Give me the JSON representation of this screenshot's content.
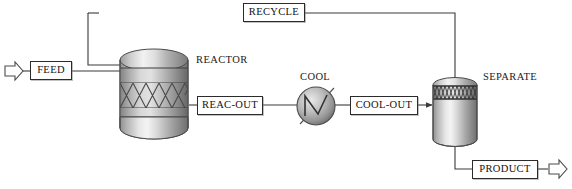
{
  "diagram": {
    "background_color": "#ffffff",
    "line_color": "#3a3a3a",
    "text_color": "#111111",
    "width": 572,
    "height": 189
  },
  "unit_labels": [
    {
      "id": "reactor",
      "text": "REACTOR",
      "x": 196,
      "y": 55
    },
    {
      "id": "cool",
      "text": "COOL",
      "x": 300,
      "y": 72
    },
    {
      "id": "separate",
      "text": "SEPARATE",
      "x": 483,
      "y": 72
    }
  ],
  "stream_labels": [
    {
      "id": "feed",
      "text": "FEED",
      "x": 30,
      "y": 61,
      "w": 42,
      "h": 19
    },
    {
      "id": "recycle",
      "text": "RECYCLE",
      "x": 243,
      "y": 3,
      "w": 62,
      "h": 19
    },
    {
      "id": "reac-out",
      "text": "REAC-OUT",
      "x": 197,
      "y": 96,
      "w": 66,
      "h": 19
    },
    {
      "id": "cool-out",
      "text": "COOL-OUT",
      "x": 350,
      "y": 96,
      "w": 68,
      "h": 19
    },
    {
      "id": "product",
      "text": "PRODUCT",
      "x": 472,
      "y": 160,
      "w": 66,
      "h": 19
    }
  ],
  "equipment": [
    {
      "id": "reactor-vessel",
      "type": "packed-column",
      "x": 119,
      "y": 50,
      "w": 70,
      "h": 88
    },
    {
      "id": "cooler-exchanger",
      "type": "heat-exchanger",
      "cx": 316,
      "cy": 106,
      "r": 19
    },
    {
      "id": "separator-vessel",
      "type": "flash-drum",
      "x": 432,
      "y": 79,
      "w": 46,
      "h": 67
    }
  ],
  "io_arrows": [
    {
      "id": "feed-inlet-arrow",
      "direction": "right",
      "x": 4,
      "y": 63
    },
    {
      "id": "product-outlet-arrow",
      "direction": "right",
      "x": 548,
      "y": 162
    }
  ],
  "connections": [
    {
      "id": "feed-to-reactor",
      "from": "FEED",
      "to": "REACTOR"
    },
    {
      "id": "recycle-to-reactor",
      "from": "RECYCLE",
      "to": "REACTOR"
    },
    {
      "id": "reactor-to-reac-out",
      "from": "REACTOR",
      "to": "REAC-OUT"
    },
    {
      "id": "reac-out-to-cool",
      "from": "REAC-OUT",
      "to": "COOL"
    },
    {
      "id": "cool-to-cool-out",
      "from": "COOL",
      "to": "COOL-OUT"
    },
    {
      "id": "cool-out-to-separate",
      "from": "COOL-OUT",
      "to": "SEPARATE"
    },
    {
      "id": "separate-to-recycle",
      "from": "SEPARATE",
      "to": "RECYCLE"
    },
    {
      "id": "separate-to-product",
      "from": "SEPARATE",
      "to": "PRODUCT"
    }
  ]
}
